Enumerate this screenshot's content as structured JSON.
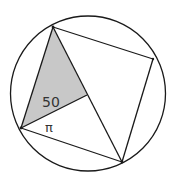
{
  "diagram": {
    "type": "geometry",
    "circle": {
      "cx": 88,
      "cy": 93.5,
      "r": 77.5
    },
    "points": {
      "top": [
        53,
        27
      ],
      "right": [
        153,
        59
      ],
      "bottom": [
        122,
        162
      ],
      "left": [
        21,
        128
      ],
      "interior": [
        87,
        95
      ]
    },
    "colors": {
      "stroke": "#1a1a1a",
      "shade": "#c8c8c8",
      "background": "#ffffff"
    },
    "labels": {
      "angle_value": "50",
      "angle_pi": "π"
    }
  }
}
